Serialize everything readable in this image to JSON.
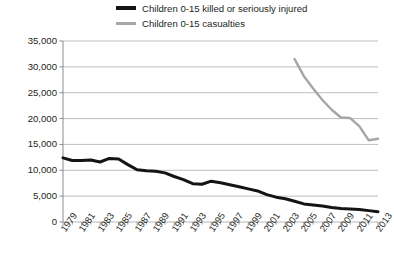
{
  "chart_data": {
    "type": "line",
    "title": "",
    "subtitle": "",
    "xlabel": "",
    "ylabel": "",
    "xlim": [
      1979,
      2013
    ],
    "ylim": [
      0,
      35000
    ],
    "grid": true,
    "legend_position": "top",
    "y_ticks": [
      "0",
      "5,000",
      "10,000",
      "15,000",
      "20,000",
      "25,000",
      "30,000",
      "35,000"
    ],
    "y_tick_values": [
      0,
      5000,
      10000,
      15000,
      20000,
      25000,
      30000,
      35000
    ],
    "x_ticks": [
      "1979",
      "1981",
      "1983",
      "1985",
      "1987",
      "1989",
      "1991",
      "1993",
      "1995",
      "1997",
      "1999",
      "2001",
      "2003",
      "2005",
      "2007",
      "2009",
      "2011",
      "2013"
    ],
    "x_tick_values": [
      1979,
      1981,
      1983,
      1985,
      1987,
      1989,
      1991,
      1993,
      1995,
      1997,
      1999,
      2001,
      2003,
      2005,
      2007,
      2009,
      2011,
      2013
    ],
    "x_minor_ticks": [
      1980,
      1982,
      1984,
      1986,
      1988,
      1990,
      1992,
      1994,
      1996,
      1998,
      2000,
      2002,
      2004,
      2006,
      2008,
      2010,
      2012
    ],
    "series": [
      {
        "name": "Children 0-15 killed or seriously injured",
        "color": "#141414",
        "width": 3.0,
        "x": [
          1979,
          1980,
          1981,
          1982,
          1983,
          1984,
          1985,
          1986,
          1987,
          1988,
          1989,
          1990,
          1991,
          1992,
          1993,
          1994,
          1995,
          1996,
          1997,
          1998,
          1999,
          2000,
          2001,
          2002,
          2003,
          2004,
          2005,
          2006,
          2007,
          2008,
          2009,
          2010,
          2011,
          2012,
          2013
        ],
        "values": [
          12400,
          11900,
          11900,
          12000,
          11600,
          12300,
          12200,
          11100,
          10100,
          9900,
          9800,
          9500,
          8800,
          8200,
          7400,
          7300,
          7900,
          7600,
          7200,
          6800,
          6400,
          6000,
          5300,
          4800,
          4500,
          4000,
          3500,
          3300,
          3100,
          2800,
          2600,
          2500,
          2400,
          2200,
          2000
        ]
      },
      {
        "name": "Children 0-15 casualties",
        "color": "#a6a6a6",
        "width": 2.4,
        "x": [
          2004,
          2005,
          2006,
          2007,
          2008,
          2009,
          2010,
          2011,
          2012,
          2013
        ],
        "values": [
          31500,
          28200,
          25800,
          23600,
          21700,
          20200,
          20100,
          18500,
          15800,
          16100
        ]
      }
    ]
  },
  "legend": {
    "items": [
      {
        "label": "Children 0-15 killed or seriously injured",
        "marker": "line-thick-black"
      },
      {
        "label": "Children 0-15 casualties",
        "marker": "line-grey"
      }
    ]
  },
  "colors": {
    "series_ksi": "#141414",
    "series_casualties": "#a6a6a6",
    "gridline": "#b8b8b8",
    "axis": "#8c8c8c",
    "text": "#231f20",
    "background": "#ffffff"
  }
}
